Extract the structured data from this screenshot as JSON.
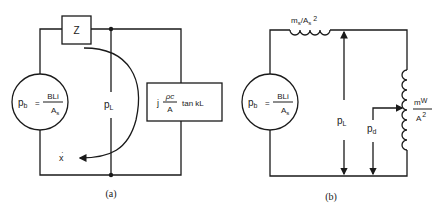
{
  "diagram_a": {
    "caption": "(a)",
    "source": {
      "lhs": "p",
      "lhs_sub": "b",
      "eq": "=",
      "num": "BLi",
      "den": "A",
      "den_sub": "s"
    },
    "series_impedance": "Z",
    "load_pressure": {
      "main": "p",
      "sub": "L"
    },
    "load_impedance": {
      "prefix": "j",
      "num": "ρc",
      "den": "A",
      "suffix": "tan kL"
    },
    "loop_velocity": {
      "main": "x",
      "dot": "·"
    }
  },
  "diagram_b": {
    "caption": "(b)",
    "source": {
      "lhs": "p",
      "lhs_sub": "b",
      "eq": "=",
      "num": "BLi",
      "den": "A",
      "den_sub": "s"
    },
    "series_inductor": {
      "m": "m",
      "m_sub": "s",
      "slash": "/",
      "a": "A",
      "a_sub": "s",
      "exp": "2"
    },
    "load_pressure": {
      "main": "p",
      "sub": "L"
    },
    "shunt_inductor": {
      "num": "m",
      "num_sub": "W",
      "den": "A",
      "den_exp": "2"
    },
    "tap_pressure": {
      "main": "p",
      "sub": "d"
    }
  },
  "colors": {
    "ink": "#1a1a1a",
    "background": "#ffffff"
  }
}
